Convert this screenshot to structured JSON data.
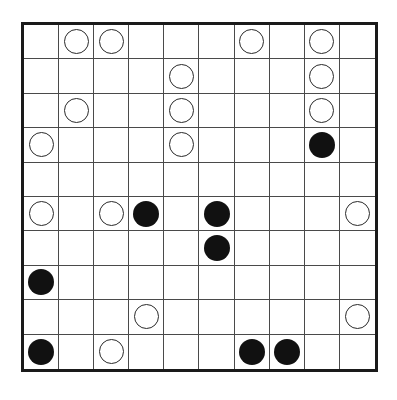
{
  "puzzle": {
    "type": "masyu",
    "rows": 10,
    "cols": 10,
    "colors": {
      "border": "#1a1a1a",
      "grid_line": "#4a4a4a",
      "white_pearl_fill": "#ffffff",
      "white_pearl_stroke": "#2a2a2a",
      "black_pearl_fill": "#111111",
      "background": "#ffffff"
    },
    "grid": [
      [
        ".",
        "W",
        "W",
        ".",
        ".",
        ".",
        "W",
        ".",
        "W",
        "."
      ],
      [
        ".",
        ".",
        ".",
        ".",
        "W",
        ".",
        ".",
        ".",
        "W",
        "."
      ],
      [
        ".",
        "W",
        ".",
        ".",
        "W",
        ".",
        ".",
        ".",
        "W",
        "."
      ],
      [
        "W",
        ".",
        ".",
        ".",
        "W",
        ".",
        ".",
        ".",
        "B",
        "."
      ],
      [
        ".",
        ".",
        ".",
        ".",
        ".",
        ".",
        ".",
        ".",
        ".",
        "."
      ],
      [
        "W",
        ".",
        "W",
        "B",
        ".",
        "B",
        ".",
        ".",
        ".",
        "W"
      ],
      [
        ".",
        ".",
        ".",
        ".",
        ".",
        "B",
        ".",
        ".",
        ".",
        "."
      ],
      [
        "B",
        ".",
        ".",
        ".",
        ".",
        ".",
        ".",
        ".",
        ".",
        "."
      ],
      [
        ".",
        ".",
        ".",
        "W",
        ".",
        ".",
        ".",
        ".",
        ".",
        "W"
      ],
      [
        "B",
        ".",
        "W",
        ".",
        ".",
        ".",
        "B",
        "B",
        ".",
        "."
      ]
    ],
    "legend": {
      "W": "white-pearl",
      "B": "black-pearl",
      ".": "empty"
    },
    "counts": {
      "white": 18,
      "black": 9
    }
  }
}
